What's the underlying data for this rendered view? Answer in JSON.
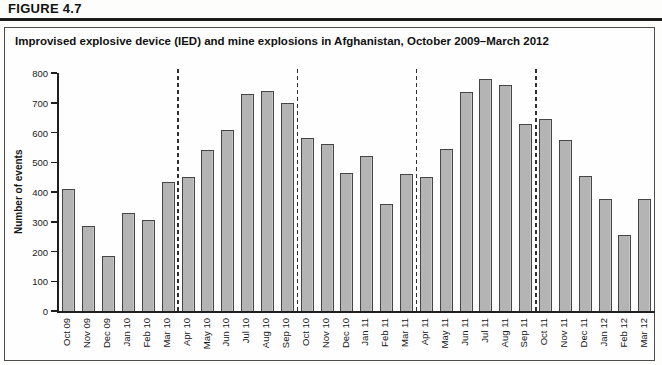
{
  "figure_label": "FIGURE 4.7",
  "panel": {
    "title": "Improvised explosive device (IED) and mine explosions in Afghanistan, October 2009–March 2012"
  },
  "chart_data": {
    "type": "bar",
    "title": "Improvised explosive device (IED) and mine explosions in Afghanistan, October 2009–March 2012",
    "xlabel": "",
    "ylabel": "Number of events",
    "ylim": [
      0,
      800
    ],
    "yticks": [
      0,
      100,
      200,
      300,
      400,
      500,
      600,
      700,
      800
    ],
    "grid": false,
    "legend": "none",
    "bar_fill_color": "#b4b4b4",
    "bar_border_color": "#454545",
    "separator_note": "vertical dashed lines marking 6-month reporting periods",
    "separators_after_index": [
      5,
      11,
      17,
      23
    ],
    "categories": [
      "Oct 09",
      "Nov 09",
      "Dec 09",
      "Jan 10",
      "Feb 10",
      "Mar 10",
      "Apr 10",
      "May 10",
      "Jun 10",
      "Jul 10",
      "Aug 10",
      "Sep 10",
      "Oct 10",
      "Nov 10",
      "Dec 10",
      "Jan 11",
      "Feb 11",
      "Mar 11",
      "Apr 11",
      "May 11",
      "Jun 11",
      "Jul 11",
      "Aug 11",
      "Sep 11",
      "Oct 11",
      "Nov 11",
      "Dec 11",
      "Jan 12",
      "Feb 12",
      "Mar 12"
    ],
    "values": [
      410,
      285,
      185,
      330,
      305,
      435,
      450,
      540,
      610,
      730,
      740,
      700,
      580,
      560,
      465,
      520,
      360,
      460,
      450,
      545,
      735,
      780,
      760,
      630,
      645,
      575,
      455,
      375,
      255,
      375
    ]
  }
}
